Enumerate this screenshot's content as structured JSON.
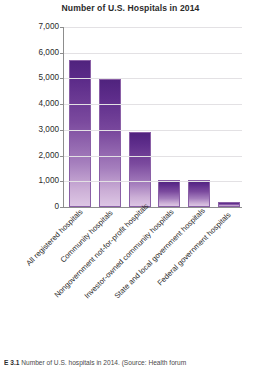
{
  "chart_data": {
    "type": "bar",
    "title": "Number of U.S. Hospitals in 2014",
    "xlabel": "",
    "ylabel": "",
    "ylim": [
      0,
      7000
    ],
    "ytick_step": 1000,
    "grid": true,
    "legend": "none",
    "bar_color_top": "#50237E",
    "bar_color_bottom": "#DDC6E4",
    "categories": [
      "All registered hospitals",
      "Community hospitals",
      "Nongovernment not-for-profit hospitals",
      "Investor-owned community hospitals",
      "State and local government hospitals",
      "Federal government hospitals"
    ],
    "values": [
      5700,
      4990,
      2900,
      1060,
      1050,
      210
    ],
    "ytick_labels": [
      "7,000",
      "6,000",
      "5,000",
      "4,000",
      "3,000",
      "2,000",
      "1,000",
      "0"
    ],
    "ytick_values": [
      7000,
      6000,
      5000,
      4000,
      3000,
      2000,
      1000,
      0
    ]
  },
  "caption": {
    "number": "E 3.1",
    "text": "Number of U.S. hospitals in 2014. (Source: Health forum"
  }
}
